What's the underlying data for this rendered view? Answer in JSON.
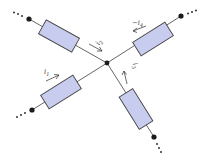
{
  "diagram": {
    "type": "kirchhoff-current-node",
    "node": {
      "x": 107,
      "y": 63
    },
    "branches": [
      {
        "id": "b1",
        "label": "i_1",
        "label_text": "i",
        "label_sub": "1",
        "direction": "into-node",
        "terminal": {
          "x": 32,
          "y": 110
        },
        "resistor_center": {
          "x": 61,
          "y": 92
        }
      },
      {
        "id": "b2",
        "label": "i_2",
        "label_text": "i",
        "label_sub": "2",
        "direction": "into-node",
        "terminal": {
          "x": 29,
          "y": 19
        },
        "resistor_center": {
          "x": 59,
          "y": 36
        }
      },
      {
        "id": "b3",
        "label": "i_3",
        "label_text": "i",
        "label_sub": "3",
        "direction": "into-node",
        "terminal": {
          "x": 154,
          "y": 137
        },
        "resistor_center": {
          "x": 136,
          "y": 109
        }
      },
      {
        "id": "b4",
        "label": "-i_4",
        "label_text": "−i",
        "label_sub": "4",
        "direction": "away-from-node-shown-negated",
        "terminal": {
          "x": 181,
          "y": 16
        },
        "resistor_center": {
          "x": 153,
          "y": 39
        }
      }
    ],
    "colors": {
      "resistor_fill": "#c8cdf0",
      "wire": "#555555",
      "node": "#1a1a1a"
    }
  }
}
